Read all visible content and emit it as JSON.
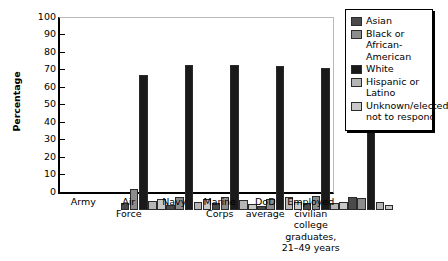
{
  "chart_data": {
    "type": "bar",
    "title": "",
    "xlabel": "",
    "ylabel": "Percentage",
    "ylim": [
      0,
      100
    ],
    "yticks": [
      0,
      10,
      20,
      30,
      40,
      50,
      60,
      70,
      80,
      90,
      100
    ],
    "grid": false,
    "legend_position": "right",
    "categories": [
      "Army",
      "Air Force",
      "Navy",
      "Marine Corps",
      "DoD average",
      "Employed civilian college graduates, 21–49 years"
    ],
    "series": [
      {
        "name": "Asian",
        "color": "#4a4a4a",
        "values": [
          4,
          2.5,
          4,
          2,
          4,
          7
        ]
      },
      {
        "name": "Black or African-American",
        "color": "#8c8c8c",
        "values": [
          12,
          7,
          7,
          6,
          7.5,
          6.5
        ]
      },
      {
        "name": "White",
        "color": "#1a1a1a",
        "values": [
          77,
          83,
          83,
          82,
          81,
          80
        ]
      },
      {
        "name": "Hispanic or Latino",
        "color": "#b5b5b5",
        "values": [
          5,
          4.5,
          5.5,
          7,
          4,
          4.5
        ]
      },
      {
        "name": "Unknown/elected not to respond",
        "color": "#c8c8c8",
        "values": [
          6,
          6,
          3,
          4.5,
          4.5,
          2.5
        ]
      }
    ]
  },
  "legend": {
    "items": [
      {
        "label": "Asian",
        "color": "#4a4a4a"
      },
      {
        "label": "Black or African-American",
        "color": "#8c8c8c"
      },
      {
        "label": "White",
        "color": "#1a1a1a"
      },
      {
        "label": "Hispanic or Latino",
        "color": "#b5b5b5"
      },
      {
        "label": "Unknown/elected not to respond",
        "color": "#c8c8c8"
      }
    ]
  },
  "axis": {
    "y_title": "Percentage",
    "y_tick_labels": [
      "100",
      "90",
      "80",
      "70",
      "60",
      "50",
      "40",
      "30",
      "20",
      "10",
      "0"
    ]
  },
  "x_axis_labels": [
    "Army",
    "Air\nForce",
    "Navy",
    "Marine\nCorps",
    "DoD\naverage",
    "Employed\ncivilian\ncollege\ngraduates,\n21–49 years"
  ]
}
